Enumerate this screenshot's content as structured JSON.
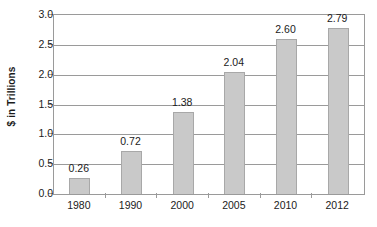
{
  "chart_data": {
    "type": "bar",
    "title": "",
    "subtitle": "",
    "xlabel": "",
    "ylabel": "$ in Trillions",
    "categories": [
      "1980",
      "1990",
      "2000",
      "2005",
      "2010",
      "2012"
    ],
    "values": [
      0.26,
      0.72,
      1.38,
      2.04,
      2.6,
      2.79
    ],
    "data_labels": [
      "0.26",
      "0.72",
      "1.38",
      "2.04",
      "2.60",
      "2.79"
    ],
    "ylim": [
      0.0,
      3.0
    ],
    "ytick_values": [
      0.0,
      0.5,
      1.0,
      1.5,
      2.0,
      2.5,
      3.0
    ],
    "ytick_labels": [
      "0.0",
      "0.5",
      "1.0",
      "1.5",
      "2.0",
      "2.5",
      "3.0"
    ],
    "grid": "horizontal",
    "legend": "none",
    "series": [
      {
        "name": "$ in Trillions",
        "values": [
          0.26,
          0.72,
          1.38,
          2.04,
          2.6,
          2.79
        ]
      }
    ],
    "colors": {
      "bar_fill": "#c9c9c9",
      "bar_stroke": "#a8a8a8",
      "grid": "#9a9a9a",
      "axis": "#9a9a9a",
      "text": "#1b1b1b",
      "background": "#ffffff"
    }
  }
}
